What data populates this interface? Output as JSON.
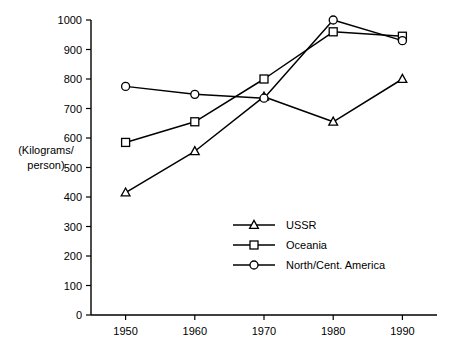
{
  "chart_data": {
    "type": "line",
    "title": "",
    "xlabel": "",
    "ylabel": "(Kilograms/\nperson)",
    "ylabel_line1": "(Kilograms/",
    "ylabel_line2": "person)",
    "categories": [
      "1950",
      "1960",
      "1970",
      "1980",
      "1990"
    ],
    "x": [
      1950,
      1960,
      1970,
      1980,
      1990
    ],
    "xlim": [
      1945,
      1995
    ],
    "ylim": [
      0,
      1000
    ],
    "ytick_labels": [
      "0",
      "100",
      "200",
      "300",
      "400",
      "500",
      "600",
      "700",
      "800",
      "900",
      "1000"
    ],
    "yticks": [
      0,
      100,
      200,
      300,
      400,
      500,
      600,
      700,
      800,
      900,
      1000
    ],
    "xtick_labels": [
      "1950",
      "1960",
      "1970",
      "1980",
      "1990"
    ],
    "grid": false,
    "legend_position": "center",
    "series": [
      {
        "name": "USSR",
        "marker": "triangle",
        "color": "#000000",
        "values": [
          415,
          555,
          740,
          655,
          800
        ]
      },
      {
        "name": "Oceania",
        "marker": "square",
        "color": "#000000",
        "values": [
          585,
          655,
          800,
          960,
          945
        ]
      },
      {
        "name": "North/Cent. America",
        "marker": "circle",
        "color": "#000000",
        "values": [
          775,
          748,
          735,
          1000,
          930
        ]
      }
    ]
  },
  "legend": {
    "items": [
      {
        "label": "USSR",
        "marker": "triangle"
      },
      {
        "label": "Oceania",
        "marker": "square"
      },
      {
        "label": "North/Cent. America",
        "marker": "circle"
      }
    ]
  }
}
